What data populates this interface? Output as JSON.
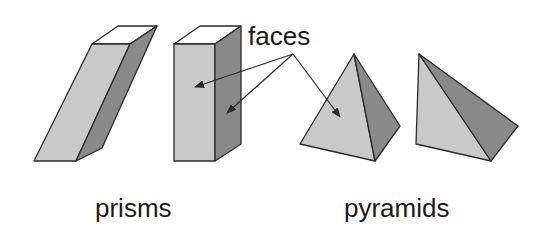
{
  "labels": {
    "faces": "faces",
    "prisms": "prisms",
    "pyramids": "pyramids"
  },
  "colors": {
    "light_face": "#c9c9c9",
    "dark_face": "#8a8a8a",
    "top_face": "#ffffff",
    "outline": "#2a2a2a",
    "text": "#1a1a1a"
  },
  "groups": [
    {
      "name": "prisms",
      "shapes": [
        "oblique-prism",
        "right-prism"
      ]
    },
    {
      "name": "pyramids",
      "shapes": [
        "right-pyramid",
        "oblique-pyramid"
      ]
    }
  ]
}
